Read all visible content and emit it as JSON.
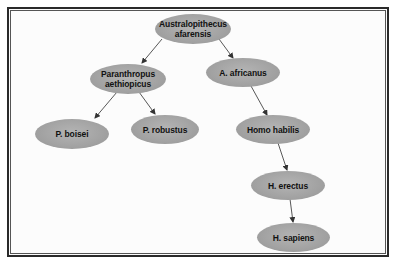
{
  "diagram": {
    "type": "phylogenetic-tree",
    "nodes": [
      {
        "id": "afarensis",
        "label": "Australopithecus\nafarensis"
      },
      {
        "id": "aethiopicus",
        "label": "Paranthropus\naethiopicus"
      },
      {
        "id": "africanus",
        "label": "A. africanus"
      },
      {
        "id": "boisei",
        "label": "P. boisei"
      },
      {
        "id": "robustus",
        "label": "P. robustus"
      },
      {
        "id": "habilis",
        "label": "Homo habilis"
      },
      {
        "id": "erectus",
        "label": "H. erectus"
      },
      {
        "id": "sapiens",
        "label": "H. sapiens"
      }
    ],
    "edges": [
      {
        "from": "afarensis",
        "to": "aethiopicus"
      },
      {
        "from": "afarensis",
        "to": "africanus"
      },
      {
        "from": "aethiopicus",
        "to": "boisei"
      },
      {
        "from": "aethiopicus",
        "to": "robustus"
      },
      {
        "from": "africanus",
        "to": "habilis"
      },
      {
        "from": "habilis",
        "to": "erectus"
      },
      {
        "from": "erectus",
        "to": "sapiens"
      }
    ],
    "colors": {
      "node_fill": "#a6a6a6",
      "edge": "#333333",
      "border": "#2a2a2a"
    }
  }
}
